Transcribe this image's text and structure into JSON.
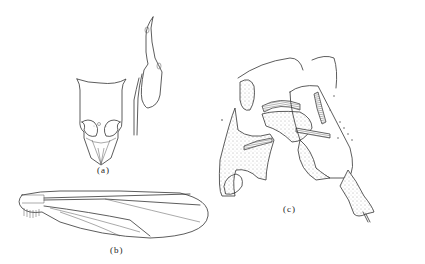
{
  "figure": {
    "panels": [
      {
        "id": "a",
        "label": "(a)",
        "description": "head, frontal and lateral view"
      },
      {
        "id": "b",
        "label": "(b)",
        "description": "wing"
      },
      {
        "id": "c",
        "label": "(c)",
        "description": "male genitalia"
      }
    ]
  }
}
